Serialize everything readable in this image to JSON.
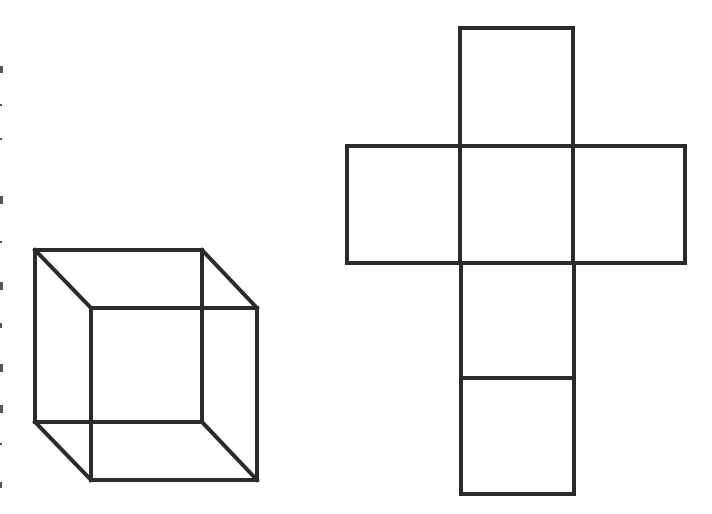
{
  "figure": {
    "stroke_color": "#2b2b2b",
    "background": "#ffffff"
  },
  "cube": {
    "back_face": {
      "x": 35,
      "y": 250,
      "w": 167,
      "h": 172
    },
    "front_face": {
      "x": 91,
      "y": 308,
      "w": 166,
      "h": 172
    }
  },
  "net": {
    "faces": [
      {
        "name": "top",
        "x": 460,
        "y": 28,
        "w": 113,
        "h": 118
      },
      {
        "name": "left",
        "x": 347,
        "y": 146,
        "w": 113,
        "h": 117
      },
      {
        "name": "center",
        "x": 460,
        "y": 146,
        "w": 113,
        "h": 117
      },
      {
        "name": "right",
        "x": 573,
        "y": 146,
        "w": 112,
        "h": 117
      },
      {
        "name": "lower",
        "x": 460,
        "y": 263,
        "w": 113,
        "h": 115
      },
      {
        "name": "bottom",
        "x": 460,
        "y": 378,
        "w": 113,
        "h": 116
      }
    ]
  }
}
